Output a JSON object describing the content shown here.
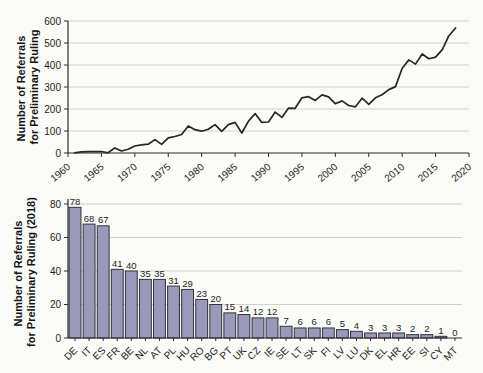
{
  "colors": {
    "grid": "#cbcbc8",
    "axis": "#2b2b2b",
    "text": "#1c1c1c",
    "background": "#fbfbf8"
  },
  "chart_data": [
    {
      "type": "line",
      "title": "",
      "xlabel": "",
      "ylabel": "Number of Referrals for Preliminary Ruling",
      "ylabel_lines": [
        "Number of Referrals",
        "for Preliminary Ruling"
      ],
      "xlim": [
        1960,
        2020
      ],
      "ylim": [
        0,
        600
      ],
      "xticks": [
        1960,
        1965,
        1970,
        1975,
        1980,
        1985,
        1990,
        1995,
        2000,
        2005,
        2010,
        2015,
        2020
      ],
      "yticks": [
        0,
        100,
        200,
        300,
        400,
        500,
        600
      ],
      "grid": true,
      "legend": "none",
      "line_color": "#262626",
      "x": [
        1961,
        1962,
        1963,
        1964,
        1965,
        1966,
        1967,
        1968,
        1969,
        1970,
        1971,
        1972,
        1973,
        1974,
        1975,
        1976,
        1977,
        1978,
        1979,
        1980,
        1981,
        1982,
        1983,
        1984,
        1985,
        1986,
        1987,
        1988,
        1989,
        1990,
        1991,
        1992,
        1993,
        1994,
        1995,
        1996,
        1997,
        1998,
        1999,
        2000,
        2001,
        2002,
        2003,
        2004,
        2005,
        2006,
        2007,
        2008,
        2009,
        2010,
        2011,
        2012,
        2013,
        2014,
        2015,
        2016,
        2017,
        2018
      ],
      "values": [
        1,
        5,
        6,
        6,
        7,
        1,
        23,
        9,
        17,
        32,
        37,
        40,
        61,
        39,
        69,
        75,
        84,
        123,
        106,
        99,
        108,
        129,
        98,
        129,
        139,
        91,
        144,
        179,
        139,
        141,
        186,
        162,
        204,
        203,
        251,
        256,
        239,
        264,
        255,
        224,
        237,
        216,
        210,
        249,
        221,
        251,
        265,
        288,
        302,
        385,
        423,
        404,
        450,
        428,
        436,
        470,
        533,
        568
      ]
    },
    {
      "type": "bar",
      "title": "",
      "xlabel": "",
      "ylabel": "Number of Referrals for Preliminary Ruling (2018)",
      "ylabel_lines": [
        "Number of Referrals",
        "for Preliminary Ruling (2018)"
      ],
      "ylim": [
        0,
        80
      ],
      "yticks": [
        0,
        20,
        40,
        60,
        80
      ],
      "grid": true,
      "legend": "none",
      "bar_color": "#9a99b9",
      "bar_edge_color": "#32323f",
      "value_labels": true,
      "categories": [
        "DE",
        "IT",
        "ES",
        "FR",
        "BE",
        "NL",
        "AT",
        "PL",
        "HU",
        "RO",
        "BG",
        "PT",
        "UK",
        "CZ",
        "IE",
        "SE",
        "LT",
        "SK",
        "FI",
        "LV",
        "LU",
        "DK",
        "EL",
        "HR",
        "EE",
        "SI",
        "CY",
        "MT"
      ],
      "values": [
        78,
        68,
        67,
        41,
        40,
        35,
        35,
        31,
        29,
        23,
        20,
        15,
        14,
        12,
        12,
        7,
        6,
        6,
        6,
        5,
        4,
        3,
        3,
        3,
        2,
        2,
        1,
        0
      ]
    }
  ]
}
